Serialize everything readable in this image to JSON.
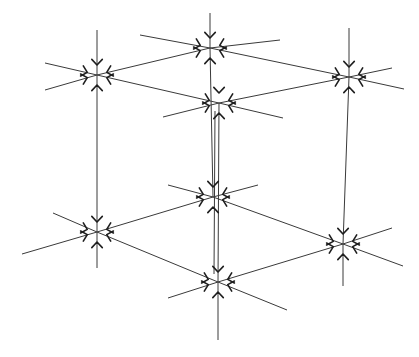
{
  "diagram": {
    "width": 419,
    "height": 357,
    "colors": {
      "background": "#ffffff",
      "line": "#3a3a3a",
      "marker": "#1e1e1e"
    },
    "nodes": [
      {
        "id": "top-back",
        "x": 210,
        "y": 48
      },
      {
        "id": "top-left",
        "x": 97,
        "y": 75
      },
      {
        "id": "top-right",
        "x": 349,
        "y": 77
      },
      {
        "id": "top-front",
        "x": 219,
        "y": 103
      },
      {
        "id": "bottom-back",
        "x": 213,
        "y": 197
      },
      {
        "id": "bottom-left",
        "x": 97,
        "y": 232
      },
      {
        "id": "bottom-right",
        "x": 343,
        "y": 244
      },
      {
        "id": "bottom-front",
        "x": 218,
        "y": 282
      }
    ],
    "edges": [
      [
        "top-back",
        "top-left"
      ],
      [
        "top-back",
        "top-right"
      ],
      [
        "top-left",
        "top-front"
      ],
      [
        "top-right",
        "top-front"
      ],
      [
        "bottom-back",
        "bottom-left"
      ],
      [
        "bottom-back",
        "bottom-right"
      ],
      [
        "bottom-left",
        "bottom-front"
      ],
      [
        "bottom-right",
        "bottom-front"
      ],
      [
        "top-back",
        "bottom-back"
      ],
      [
        "top-left",
        "bottom-left"
      ],
      [
        "top-right",
        "bottom-right"
      ],
      [
        "top-front",
        "bottom-front"
      ]
    ],
    "extensions": [
      [
        210,
        48,
        210,
        13
      ],
      [
        210,
        48,
        140,
        35
      ],
      [
        210,
        48,
        280,
        40
      ],
      [
        97,
        75,
        97,
        30
      ],
      [
        97,
        75,
        45,
        90
      ],
      [
        97,
        75,
        45,
        63
      ],
      [
        349,
        77,
        349,
        28
      ],
      [
        349,
        77,
        392,
        68
      ],
      [
        349,
        77,
        404,
        89
      ],
      [
        219,
        103,
        163,
        117
      ],
      [
        219,
        103,
        283,
        118
      ],
      [
        213,
        197,
        168,
        185
      ],
      [
        213,
        197,
        258,
        185
      ],
      [
        97,
        232,
        97,
        268
      ],
      [
        97,
        232,
        53,
        213
      ],
      [
        97,
        232,
        22,
        254
      ],
      [
        343,
        244,
        343,
        286
      ],
      [
        343,
        244,
        392,
        228
      ],
      [
        343,
        244,
        403,
        266
      ],
      [
        218,
        282,
        218,
        340
      ],
      [
        218,
        282,
        168,
        298
      ],
      [
        218,
        282,
        287,
        310
      ]
    ]
  }
}
